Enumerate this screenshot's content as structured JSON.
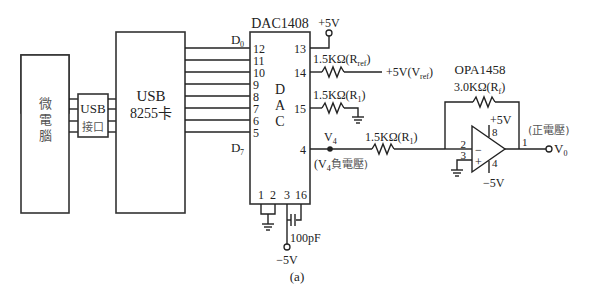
{
  "figure": {
    "caption": "(a)",
    "blocks": {
      "microcomputer": {
        "label_chars": [
          "微",
          "電",
          "腦"
        ]
      },
      "usb_interface": {
        "line1": "USB",
        "line2": "接口"
      },
      "usb_card": {
        "line1": "USB",
        "line2": "8255卡"
      },
      "dac": {
        "title": "DAC1408",
        "inner_chars": [
          "D",
          "A",
          "C"
        ],
        "data_msb_label": "D",
        "data_msb_sub": "0",
        "data_lsb_label": "D",
        "data_lsb_sub": "7",
        "left_pins": [
          "12",
          "11",
          "10",
          "9",
          "8",
          "7",
          "6",
          "5"
        ],
        "right_pins": [
          "13",
          "14",
          "15",
          "4"
        ],
        "bottom_pins": [
          "1",
          "2",
          "3",
          "16"
        ]
      },
      "opamp": {
        "title": "OPA1458",
        "pin_inv": "2",
        "pin_noninv": "3",
        "pin_vplus": "8",
        "pin_vminus": "4",
        "pin_out": "1",
        "minus_sign": "−",
        "plus_sign": "+"
      }
    },
    "labels": {
      "vcc_top": "+5V",
      "rref": {
        "value": "1.5KΩ(R",
        "sub": "ref",
        "close": ")"
      },
      "vref": {
        "value": "+5V(V",
        "sub": "ref",
        "close": ")"
      },
      "r1_ground": {
        "value": "1.5KΩ(R",
        "sub": "1",
        "close": ")"
      },
      "v4_node": {
        "value": "V",
        "sub": "4"
      },
      "v4_note": {
        "open": "(V",
        "sub": "4",
        "rest": "負電壓)"
      },
      "r1_series": {
        "value": "1.5KΩ(R",
        "sub": "1",
        "close": ")"
      },
      "rf": {
        "value": "3.0KΩ(R",
        "sub": "f",
        "close": ")"
      },
      "opamp_vplus": "+5V",
      "opamp_vminus": "−5V",
      "output_note": "(正電壓)",
      "vout": {
        "value": "V",
        "sub": "0"
      },
      "cap": "100pF",
      "vee": "−5V"
    }
  }
}
